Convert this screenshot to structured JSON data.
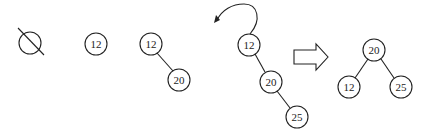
{
  "diagram": {
    "stages": [
      {
        "name": "empty",
        "symbol": "empty-set"
      },
      {
        "name": "insert-12",
        "nodes": [
          "12"
        ]
      },
      {
        "name": "insert-20",
        "nodes": [
          "12",
          "20"
        ]
      },
      {
        "name": "insert-25-unbalanced",
        "nodes": [
          "12",
          "20",
          "25"
        ]
      },
      {
        "name": "after-rotation",
        "nodes": [
          "20",
          "12",
          "25"
        ]
      }
    ],
    "labels": {
      "s2_n1": "12",
      "s3_n1": "12",
      "s3_n2": "20",
      "s4_n1": "12",
      "s4_n2": "20",
      "s4_n3": "25",
      "s5_root": "20",
      "s5_left": "12",
      "s5_right": "25"
    },
    "colors": {
      "stroke": "#222222",
      "background": "#ffffff"
    }
  }
}
